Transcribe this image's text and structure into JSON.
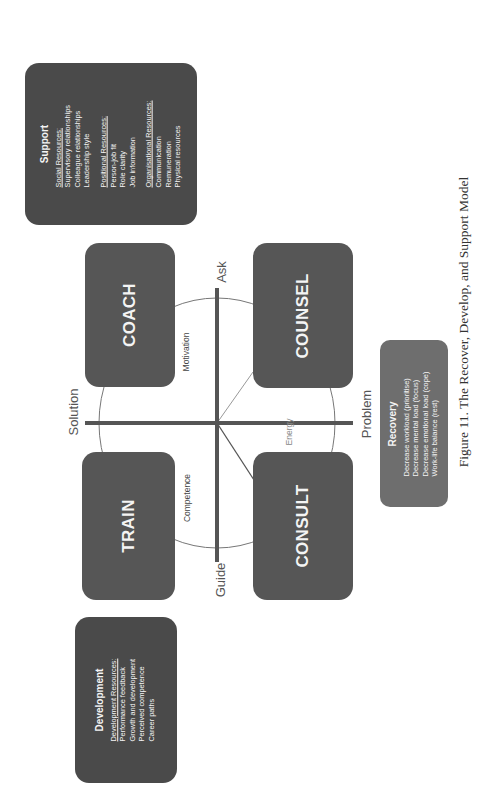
{
  "figure": {
    "caption": "Figure 11. The Recover, Develop, and Support Model",
    "orientation": "rotated 90° counter-clockwise (text reads bottom-to-top)"
  },
  "quadrants": {
    "coach": "COACH",
    "counsel": "COUNSEL",
    "train": "TRAIN",
    "consult": "CONSULT"
  },
  "axes": {
    "ask": "Ask",
    "guide": "Guide",
    "solution": "Solution",
    "problem": "Problem"
  },
  "inner_labels": {
    "motivation": "Motivation",
    "competence": "Competence",
    "energy": "Energy"
  },
  "support": {
    "title": "Support",
    "sections": [
      {
        "heading": "Social Resources:",
        "items": [
          "Supervisory relationships",
          "Colleague relationships",
          "Leadership style"
        ]
      },
      {
        "heading": "Positional Resources:",
        "items": [
          "Person-job fit",
          "Role clarity",
          "Job information"
        ]
      },
      {
        "heading": "Organisational Resources:",
        "items": [
          "Communication",
          "Remuneration",
          "Physical resources"
        ]
      }
    ]
  },
  "development": {
    "title": "Development",
    "heading": "Development Resources:",
    "items": [
      "Performance feedback",
      "Growth and development",
      "Perceived competence",
      "Career paths"
    ]
  },
  "recovery": {
    "title": "Recovery",
    "items": [
      "Decrease workload (prioritise)",
      "Decrease mental load (focus)",
      "Decrease emotional load (cope)",
      "Work-life balance (rest)"
    ]
  },
  "colors": {
    "box_dark": "#4a4a4a",
    "quadrant_box": "#565656",
    "recovery_box": "#6e6e6e",
    "axis_line": "#555555",
    "circle_line": "#777777",
    "text_light": "#f4f4f4"
  }
}
